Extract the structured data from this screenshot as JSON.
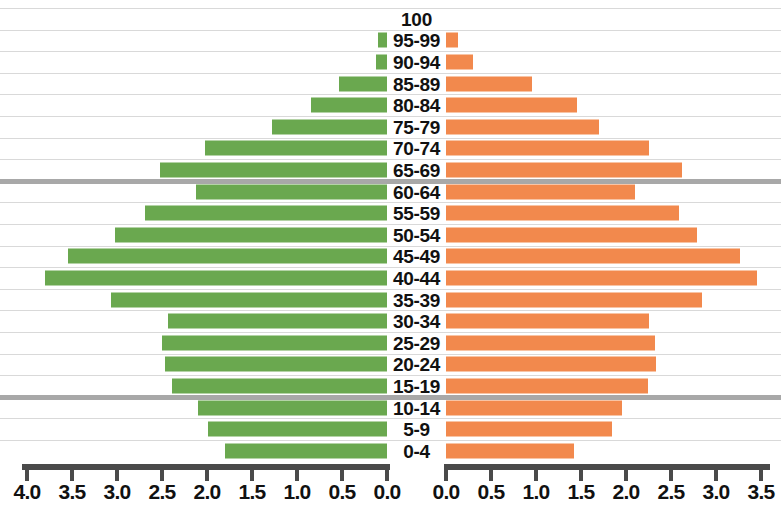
{
  "chart_data": {
    "type": "bar",
    "subtype": "population-pyramid",
    "title": "",
    "xlabel": "",
    "ylabel": "",
    "orientation": "horizontal",
    "grid": true,
    "legend_position": "none",
    "colors": {
      "left_series": "#6aa84f",
      "right_series": "#f2894d",
      "gridline": "#d9d9d9",
      "reference_line": "#a8a8a8",
      "axis": "#4a4a4a",
      "text": "#111111",
      "background": "#ffffff"
    },
    "categories": [
      "100",
      "95-99",
      "90-94",
      "85-89",
      "80-84",
      "75-79",
      "70-74",
      "65-69",
      "60-64",
      "55-59",
      "50-54",
      "45-49",
      "40-44",
      "35-39",
      "30-34",
      "25-29",
      "20-24",
      "15-19",
      "10-14",
      "5-9",
      "0-4"
    ],
    "series": [
      {
        "name": "left",
        "side": "left",
        "color": "#6aa84f",
        "axis_label_top": "",
        "values": [
          0.0,
          0.1,
          0.12,
          0.53,
          0.84,
          1.28,
          2.02,
          2.52,
          2.12,
          2.69,
          3.02,
          3.55,
          3.8,
          3.07,
          2.43,
          2.5,
          2.47,
          2.39,
          2.1,
          1.99,
          1.8
        ]
      },
      {
        "name": "right",
        "side": "right",
        "color": "#f2894d",
        "values": [
          0.0,
          0.13,
          0.3,
          0.95,
          1.46,
          1.7,
          2.26,
          2.62,
          2.1,
          2.59,
          2.79,
          3.27,
          3.45,
          2.84,
          2.26,
          2.32,
          2.33,
          2.24,
          1.96,
          1.84,
          1.42
        ]
      }
    ],
    "xlim_left": [
      4.0,
      0.0
    ],
    "xlim_right": [
      0.0,
      3.5
    ],
    "xticks_left": [
      "4.0",
      "3.5",
      "3.0",
      "2.5",
      "2.0",
      "1.5",
      "1.0",
      "0.5",
      "0.0"
    ],
    "xticks_right": [
      "0.0",
      "0.5",
      "1.0",
      "1.5",
      "2.0",
      "2.5",
      "3.0",
      "3.5"
    ],
    "reference_lines_between": [
      {
        "above": "65-69",
        "below": "60-64"
      },
      {
        "above": "15-19",
        "below": "10-14"
      }
    ]
  }
}
